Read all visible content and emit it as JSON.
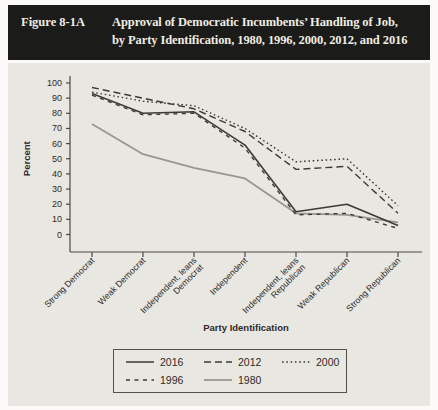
{
  "figure": {
    "label": "Figure 8-1A",
    "title_line1": "Approval of Democratic Incumbents’ Handling of Job,",
    "title_line2": "by Party Identification, 1980, 1996, 2000, 2012, and 2016"
  },
  "colors": {
    "header_bg": "#1b1b1a",
    "header_text": "#f1ece1",
    "panel_bg": "#e9e7e2",
    "axis": "#4a4846",
    "tick_text": "#2c2b29",
    "line_dark": "#3b3a38",
    "line_gray": "#999690"
  },
  "chart_data": {
    "type": "line",
    "title": "Approval of Democratic Incumbents’ Handling of Job, by Party Identification, 1980, 1996, 2000, 2012, and 2016",
    "xlabel": "Party Identification",
    "ylabel": "Percent",
    "ylim": [
      0,
      100
    ],
    "ytick_step": 10,
    "yticks": [
      100,
      90,
      80,
      70,
      60,
      50,
      40,
      30,
      20,
      10,
      0
    ],
    "grid": false,
    "legend_position": "bottom-box",
    "categories": [
      "Strong Democrat",
      "Weak Democrat",
      "Independent, leans Democrat",
      "Independent",
      "Independent, leans Republican",
      "Weak Republican",
      "Strong Republican"
    ],
    "category_label_lines": [
      [
        "Strong Democrat"
      ],
      [
        "Weak Democrat"
      ],
      [
        "Independent, leans",
        "Democrat"
      ],
      [
        "Independent"
      ],
      [
        "Independent, leans",
        "Republican"
      ],
      [
        "Weak Republican"
      ],
      [
        "Strong Republican"
      ]
    ],
    "series": [
      {
        "name": "2016",
        "style": "solid",
        "color": "dark",
        "values": [
          93,
          80,
          81,
          59,
          15,
          20,
          6
        ]
      },
      {
        "name": "2012",
        "style": "dashed",
        "color": "dark",
        "values": [
          97,
          90,
          83,
          68,
          43,
          45,
          14
        ]
      },
      {
        "name": "2000",
        "style": "dotted",
        "color": "dark",
        "values": [
          94,
          88,
          85,
          70,
          48,
          50,
          19
        ]
      },
      {
        "name": "1996",
        "style": "dashed-short",
        "color": "dark",
        "values": [
          92,
          79,
          80,
          57,
          13,
          14,
          4
        ]
      },
      {
        "name": "1980",
        "style": "solid",
        "color": "gray",
        "values": [
          73,
          53,
          44,
          37,
          14,
          13,
          8
        ]
      }
    ],
    "legend_rows": [
      [
        "2016",
        "2012",
        "2000"
      ],
      [
        "1996",
        "1980"
      ]
    ]
  }
}
